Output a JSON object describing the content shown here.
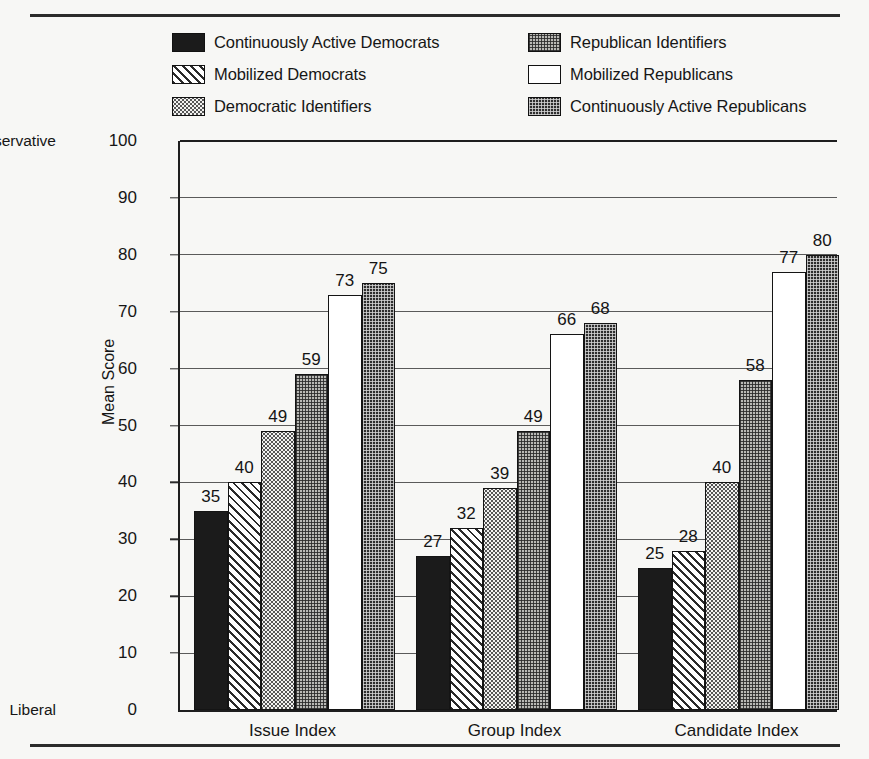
{
  "chart_data": {
    "type": "bar",
    "title": "",
    "xlabel": "",
    "ylabel": "Mean Score",
    "ylim": [
      0,
      100
    ],
    "ytick_step": 10,
    "yticks": [
      0,
      10,
      20,
      30,
      40,
      50,
      60,
      70,
      80,
      90,
      100
    ],
    "grid": true,
    "legend_position": "top",
    "axis_endpoint_labels": {
      "high": "Conservative",
      "low": "Liberal"
    },
    "categories": [
      "Issue Index",
      "Group Index",
      "Candidate Index"
    ],
    "series": [
      {
        "name": "Continuously Active Democrats",
        "pattern": "solid-black",
        "values": [
          35,
          27,
          25
        ]
      },
      {
        "name": "Mobilized Democrats",
        "pattern": "diagonal-hatch",
        "values": [
          40,
          32,
          28
        ]
      },
      {
        "name": "Democratic Identifiers",
        "pattern": "light-dot",
        "values": [
          49,
          39,
          40
        ]
      },
      {
        "name": "Republican Identifiers",
        "pattern": "mid-check",
        "values": [
          59,
          49,
          58
        ]
      },
      {
        "name": "Mobilized Republicans",
        "pattern": "white",
        "values": [
          73,
          66,
          77
        ]
      },
      {
        "name": "Continuously Active Republicans",
        "pattern": "dark-check",
        "values": [
          75,
          68,
          80
        ]
      }
    ]
  },
  "legend": {
    "columns": [
      {
        "items": [
          {
            "label": "Continuously Active Democrats",
            "pattern": "solid-black"
          },
          {
            "label": "Mobilized Democrats",
            "pattern": "diagonal-hatch"
          },
          {
            "label": "Democratic Identifiers",
            "pattern": "light-dot"
          }
        ]
      },
      {
        "items": [
          {
            "label": "Republican Identifiers",
            "pattern": "mid-check"
          },
          {
            "label": "Mobilized Republicans",
            "pattern": "white"
          },
          {
            "label": "Continuously Active Republicans",
            "pattern": "dark-check"
          }
        ]
      }
    ]
  },
  "colors": {
    "ink": "#1a1a1a",
    "page_background": "#f7f7f5",
    "gridline": "#5a5a5a",
    "axis": "#1e1e1e"
  }
}
